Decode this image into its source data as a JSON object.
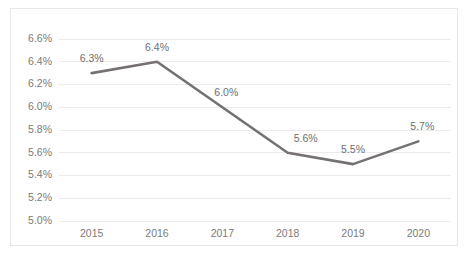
{
  "chart_data": {
    "type": "line",
    "title": "",
    "xlabel": "",
    "ylabel": "",
    "categories": [
      "2015",
      "2016",
      "2017",
      "2018",
      "2019",
      "2020"
    ],
    "values": [
      6.3,
      6.4,
      6.0,
      5.6,
      5.5,
      5.7
    ],
    "point_labels": [
      "6.3%",
      "6.4%",
      "6.0%",
      "5.6%",
      "5.5%",
      "5.7%"
    ],
    "ylim": [
      5.0,
      6.6
    ],
    "ytick_values": [
      5.0,
      5.2,
      5.4,
      5.6,
      5.8,
      6.0,
      6.2,
      6.4,
      6.6
    ],
    "ytick_labels": [
      "5.0%",
      "5.2%",
      "5.4%",
      "5.6%",
      "5.8%",
      "6.0%",
      "6.2%",
      "6.4%",
      "6.6%"
    ],
    "grid": true,
    "legend": "none",
    "series_color": "#767171",
    "gridline_color": "#eceaea",
    "tick_label_color": "#7b7b7b",
    "border_color": "#e8e8e8",
    "background_color": "#ffffff"
  }
}
